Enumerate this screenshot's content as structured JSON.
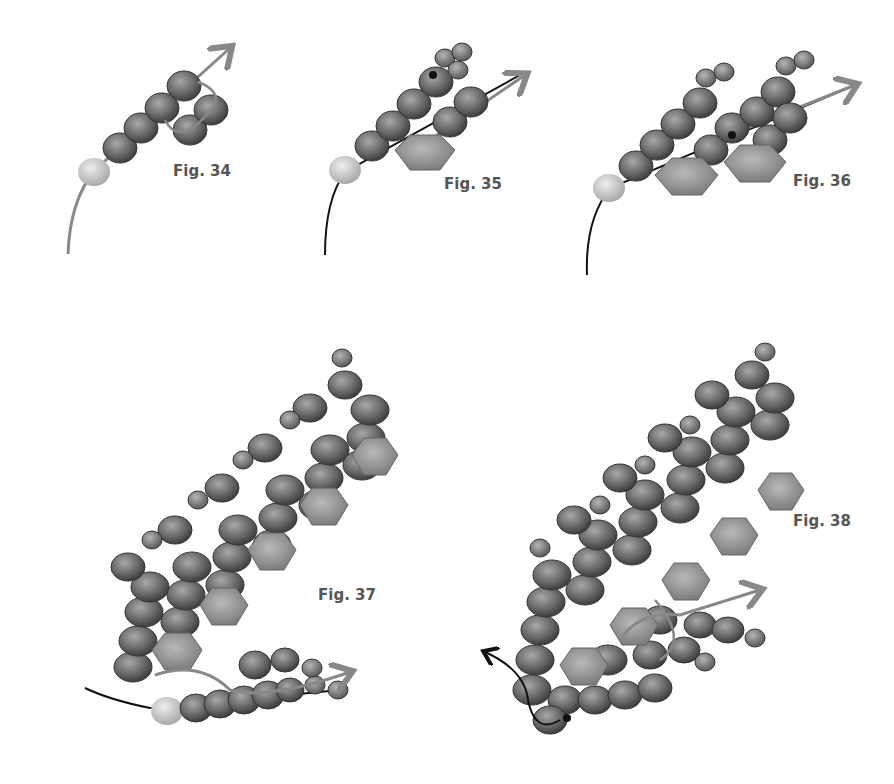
{
  "figures": [
    {
      "id": "fig34",
      "label": "Fig. 34",
      "x": 173,
      "y": 162
    },
    {
      "id": "fig35",
      "label": "Fig. 35",
      "x": 444,
      "y": 175
    },
    {
      "id": "fig36",
      "label": "Fig. 36",
      "x": 793,
      "y": 172
    },
    {
      "id": "fig37",
      "label": "Fig. 37",
      "x": 318,
      "y": 586
    },
    {
      "id": "fig38",
      "label": "Fig. 38",
      "x": 793,
      "y": 512
    }
  ],
  "colors": {
    "seed_bead": "#6f6f6f",
    "small_bead": "#8a8a8a",
    "crystal": "#9a9a9a",
    "stop_bead": "#cfcfcf",
    "thread_light": "#888888",
    "thread_dark": "#111111"
  }
}
